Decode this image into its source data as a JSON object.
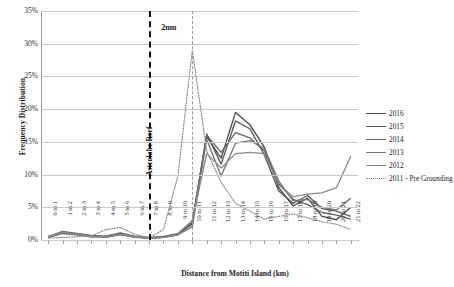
{
  "chart_data": {
    "type": "line",
    "title": "",
    "xlabel": "Distance from Motiti Island (km)",
    "ylabel": "Frequency Distribution",
    "ylim": [
      0,
      35
    ],
    "ytick_labels": [
      "0%",
      "5%",
      "10%",
      "15%",
      "20%",
      "25%",
      "30%",
      "35%"
    ],
    "ytick_values": [
      0,
      5,
      10,
      15,
      20,
      25,
      30,
      35
    ],
    "grid": true,
    "legend_position": "right",
    "categories": [
      "0 to 1",
      "1 to 2",
      "2 to 3",
      "3 to 4",
      "4 to 5",
      "5 to 6",
      "6 to 7",
      "7 to 8",
      "8 to 9",
      "9 to 10",
      "10 to 11",
      "11 to 12",
      "12 to 13",
      "13 to 14",
      "14 to 15",
      "15 to 16",
      "16 to 17",
      "17 to 18",
      "18 to 19",
      "19 to 20",
      "20 to 21",
      "21 to 22"
    ],
    "series": [
      {
        "name": "2016",
        "color": "#4a4a4a",
        "style": "solid",
        "values": [
          0.5,
          1.2,
          0.9,
          0.6,
          0.5,
          1.0,
          0.5,
          0.3,
          0.4,
          0.8,
          2.6,
          15.8,
          12.5,
          19.5,
          17.6,
          14.2,
          8.0,
          5.2,
          6.4,
          3.6,
          3.1,
          5.0
        ]
      },
      {
        "name": "2015",
        "color": "#5a5a5a",
        "style": "solid",
        "values": [
          0.4,
          1.0,
          0.8,
          0.5,
          0.6,
          0.9,
          0.4,
          0.3,
          0.5,
          0.9,
          2.4,
          16.2,
          11.6,
          18.2,
          17.0,
          13.0,
          7.5,
          5.6,
          6.8,
          4.8,
          4.4,
          3.6
        ]
      },
      {
        "name": "2014",
        "color": "#666666",
        "style": "solid",
        "values": [
          0.5,
          1.3,
          1.0,
          0.7,
          0.6,
          1.1,
          0.6,
          0.4,
          0.5,
          1.0,
          2.9,
          16.0,
          13.4,
          16.4,
          15.6,
          13.6,
          8.6,
          6.2,
          5.4,
          4.2,
          3.8,
          3.2
        ]
      },
      {
        "name": "2013",
        "color": "#777777",
        "style": "solid",
        "values": [
          0.4,
          1.1,
          0.9,
          0.5,
          0.4,
          0.8,
          0.5,
          0.3,
          0.4,
          0.8,
          2.0,
          15.4,
          9.8,
          14.8,
          15.2,
          14.0,
          9.0,
          6.0,
          6.2,
          5.0,
          4.6,
          6.4
        ]
      },
      {
        "name": "2012",
        "color": "#8a8a8a",
        "style": "solid",
        "values": [
          0.5,
          1.2,
          0.8,
          0.6,
          0.5,
          0.9,
          0.5,
          0.3,
          0.4,
          0.9,
          3.0,
          13.2,
          11.0,
          13.2,
          13.4,
          13.2,
          8.4,
          6.6,
          7.0,
          7.2,
          8.0,
          12.8
        ]
      },
      {
        "name": "2011 - Pre Grounding",
        "color": "#8a8a8a",
        "style": "dotted",
        "values": [
          0.3,
          0.4,
          0.5,
          0.6,
          1.6,
          1.9,
          0.9,
          0.3,
          1.6,
          9.8,
          29.0,
          13.6,
          8.8,
          5.6,
          4.4,
          3.2,
          3.6,
          4.0,
          3.4,
          2.8,
          2.4,
          1.6
        ]
      }
    ],
    "annotations": [
      {
        "name": "astrolabe-reef-marker",
        "label": "Astrolabe Reef",
        "category_index": 7,
        "style": "dash-dot-thick"
      },
      {
        "name": "two-nautical-mile-marker",
        "label": "2nm",
        "category_index": 10,
        "style": "dash-dot-thin"
      }
    ]
  }
}
